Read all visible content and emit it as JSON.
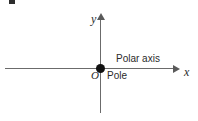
{
  "figure": {
    "type": "polar-coordinate-reference-diagram",
    "background_color": "#ffffff",
    "line_color": "#6b6b6b",
    "text_color": "#2b2b2b",
    "dot_color": "#111111"
  },
  "labels": {
    "y_axis": "y",
    "x_axis": "x",
    "origin": "O",
    "pole": "Pole",
    "polar_axis": "Polar axis"
  },
  "chart_data": {
    "type": "scatter",
    "title": "",
    "subtitle": "",
    "xlabel": "x",
    "ylabel": "y",
    "xlim": [
      -1,
      1
    ],
    "ylim": [
      -1,
      1
    ],
    "grid": false,
    "legend": "none",
    "points": [
      {
        "x": 0,
        "y": 0,
        "labels": [
          "O",
          "Pole"
        ]
      }
    ],
    "annotations": [
      {
        "text": "Polar axis",
        "x": 0.45,
        "y": 0.12
      },
      {
        "text": "Pole",
        "x": 0.07,
        "y": -0.1
      },
      {
        "text": "O",
        "x": -0.07,
        "y": -0.08
      },
      {
        "text": "y",
        "x": -0.06,
        "y": 0.95
      },
      {
        "text": "x",
        "x": 0.98,
        "y": -0.04
      }
    ],
    "axes": [
      {
        "name": "horizontal-axis",
        "arrow": "right",
        "label": "x"
      },
      {
        "name": "vertical-axis",
        "arrow": "up",
        "label": "y"
      }
    ]
  }
}
